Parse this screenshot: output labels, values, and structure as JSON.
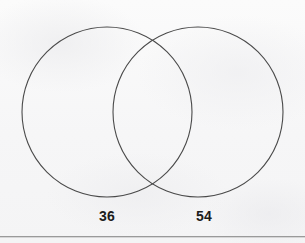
{
  "figure": {
    "kind": "venn-diagram",
    "background_color": "#f7f7f7",
    "stroke_color": "#4a4a4a",
    "label_color": "#1c1c1c",
    "rule_color": "#9a9a9a"
  },
  "chart_data": {
    "type": "diagram",
    "title": "",
    "subtitle": "",
    "xlabel": "",
    "ylabel": "",
    "diagram_kind": "venn-2-set",
    "grid": false,
    "legend": false,
    "sets": [
      {
        "name": "left-set",
        "label": "36",
        "value": 36,
        "center_x": 107,
        "center_y": 112,
        "radius": 85
      },
      {
        "name": "right-set",
        "label": "54",
        "value": 54,
        "center_x": 198,
        "center_y": 112,
        "radius": 85
      }
    ],
    "intersection": {
      "label": "",
      "value": null
    },
    "categories": [
      "36",
      "54"
    ],
    "values": [
      36,
      54
    ],
    "annotations": [
      {
        "text": "36",
        "x": 107,
        "y": 216
      },
      {
        "text": "54",
        "x": 204,
        "y": 216
      }
    ]
  },
  "labels": {
    "left": "36",
    "right": "54"
  },
  "icons": {
    "left_circle": "circle-outline-icon",
    "right_circle": "circle-outline-icon",
    "rule": "horizontal-rule-icon"
  }
}
